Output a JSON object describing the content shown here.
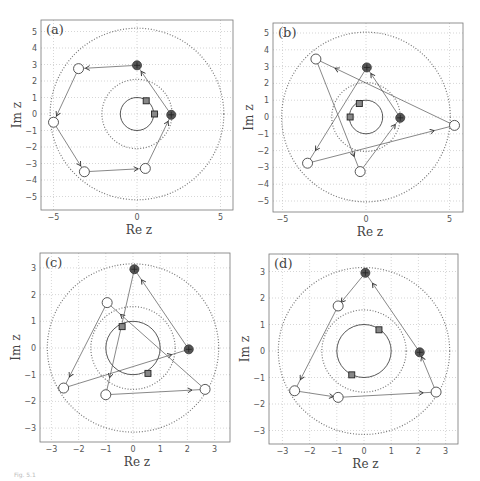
{
  "caption": "Fig. 5.1",
  "chart_data": [
    {
      "type": "scatter",
      "panel_label": "(a)",
      "xlabel": "Re z",
      "ylabel": "Im z",
      "xlim": [
        -5.7,
        5.8
      ],
      "ylim": [
        -5.8,
        5.7
      ],
      "xticks": [
        -5,
        0,
        5
      ],
      "yticks": [
        -5,
        -4,
        -3,
        -2,
        -1,
        0,
        1,
        2,
        3,
        4,
        5
      ],
      "grid": true,
      "unit_circle": {
        "center": [
          0,
          0
        ],
        "r": 1,
        "style": "solid"
      },
      "dotted_circles": [
        {
          "r": 2.1
        },
        {
          "r": 5.2
        }
      ],
      "squares": [
        [
          0.55,
          0.8
        ],
        [
          1.05,
          0.0
        ]
      ],
      "filled_markers": [
        [
          0.0,
          2.95
        ],
        [
          2.05,
          -0.05
        ]
      ],
      "open_circles": [
        [
          -3.5,
          2.75
        ],
        [
          -5.0,
          -0.5
        ],
        [
          -3.15,
          -3.5
        ],
        [
          0.5,
          -3.3
        ]
      ],
      "path": [
        [
          0.0,
          2.95
        ],
        [
          -3.5,
          2.75
        ],
        [
          -5.0,
          -0.5
        ],
        [
          -3.15,
          -3.5
        ],
        [
          0.5,
          -3.3
        ],
        [
          2.05,
          -0.05
        ],
        [
          0.0,
          2.95
        ]
      ]
    },
    {
      "type": "scatter",
      "panel_label": "(b)",
      "xlabel": "Re z",
      "ylabel": "Im z",
      "xlim": [
        -5.5,
        5.8
      ],
      "ylim": [
        -5.7,
        5.6
      ],
      "xticks": [
        -5,
        0,
        5
      ],
      "yticks": [
        -5,
        -4,
        -3,
        -2,
        -1,
        0,
        1,
        2,
        3,
        4,
        5
      ],
      "grid": true,
      "unit_circle": {
        "center": [
          0,
          0
        ],
        "r": 1,
        "style": "solid"
      },
      "dotted_circles": [
        {
          "r": 2.05
        },
        {
          "r": 5.05
        }
      ],
      "squares": [
        [
          -0.4,
          0.8
        ],
        [
          -0.95,
          0.0
        ]
      ],
      "filled_markers": [
        [
          0.05,
          2.95
        ],
        [
          2.05,
          -0.05
        ]
      ],
      "open_circles": [
        [
          -3.0,
          3.45
        ],
        [
          -3.5,
          -2.75
        ],
        [
          -0.35,
          -3.25
        ],
        [
          5.3,
          -0.5
        ]
      ],
      "path": [
        [
          0.05,
          2.95
        ],
        [
          -3.5,
          -2.75
        ],
        [
          5.3,
          -0.5
        ],
        [
          -3.0,
          3.45
        ],
        [
          -0.35,
          -3.25
        ],
        [
          2.05,
          -0.05
        ],
        [
          0.05,
          2.95
        ]
      ]
    },
    {
      "type": "scatter",
      "panel_label": "(c)",
      "xlabel": "Re z",
      "ylabel": "Im z",
      "xlim": [
        -3.4,
        3.6
      ],
      "ylim": [
        -3.5,
        3.5
      ],
      "xticks": [
        -3,
        -2,
        -1,
        0,
        1,
        2,
        3
      ],
      "yticks": [
        -3,
        -2,
        -1,
        0,
        1,
        2,
        3
      ],
      "grid": true,
      "unit_circle": {
        "center": [
          0,
          0
        ],
        "r": 1,
        "style": "solid"
      },
      "dotted_circles": [
        {
          "r": 1.55
        },
        {
          "r": 3.15
        }
      ],
      "squares": [
        [
          -0.4,
          0.8
        ],
        [
          0.55,
          -0.95
        ]
      ],
      "filled_markers": [
        [
          0.05,
          2.95
        ],
        [
          2.05,
          -0.05
        ]
      ],
      "open_circles": [
        [
          -0.95,
          1.7
        ],
        [
          -2.55,
          -1.5
        ],
        [
          -1.0,
          -1.75
        ],
        [
          2.65,
          -1.55
        ]
      ],
      "path": [
        [
          0.05,
          2.95
        ],
        [
          -1.0,
          -1.75
        ],
        [
          2.65,
          -1.55
        ],
        [
          -0.95,
          1.7
        ],
        [
          -2.55,
          -1.5
        ],
        [
          2.05,
          -0.05
        ],
        [
          0.05,
          2.95
        ]
      ]
    },
    {
      "type": "scatter",
      "panel_label": "(d)",
      "xlabel": "Re z",
      "ylabel": "Im z",
      "xlim": [
        -3.4,
        3.6
      ],
      "ylim": [
        -3.5,
        3.5
      ],
      "xticks": [
        -3,
        -2,
        -1,
        0,
        1,
        2,
        3
      ],
      "yticks": [
        -3,
        -2,
        -1,
        0,
        1,
        2,
        3
      ],
      "grid": true,
      "unit_circle": {
        "center": [
          0,
          0
        ],
        "r": 1,
        "style": "solid"
      },
      "dotted_circles": [
        {
          "r": 1.55
        },
        {
          "r": 3.15
        }
      ],
      "squares": [
        [
          0.55,
          0.8
        ],
        [
          -0.45,
          -0.9
        ]
      ],
      "filled_markers": [
        [
          0.05,
          2.95
        ],
        [
          2.05,
          -0.05
        ]
      ],
      "open_circles": [
        [
          -0.95,
          1.7
        ],
        [
          -2.55,
          -1.5
        ],
        [
          -0.95,
          -1.75
        ],
        [
          2.65,
          -1.55
        ]
      ],
      "path": [
        [
          0.05,
          2.95
        ],
        [
          -0.95,
          1.7
        ],
        [
          -2.55,
          -1.5
        ],
        [
          -0.95,
          -1.75
        ],
        [
          2.65,
          -1.55
        ],
        [
          2.05,
          -0.05
        ],
        [
          0.05,
          2.95
        ]
      ]
    }
  ],
  "layout": [
    {
      "box": [
        41,
        20,
        233,
        210
      ],
      "x0": 137,
      "sx": 16.7,
      "y0": 114,
      "sy": 16.5
    },
    {
      "box": [
        273,
        23,
        463,
        212
      ],
      "x0": 366,
      "sx": 16.7,
      "y0": 117,
      "sy": 16.8
    },
    {
      "box": [
        40,
        253,
        230,
        442
      ],
      "x0": 133,
      "sx": 27.2,
      "y0": 348,
      "sy": 26.7
    },
    {
      "box": [
        269,
        254,
        458,
        444
      ],
      "x0": 364,
      "sx": 27.2,
      "y0": 351,
      "sy": 26.5
    }
  ]
}
